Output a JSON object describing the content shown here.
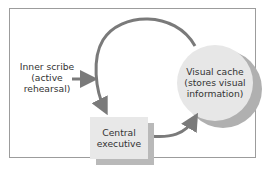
{
  "diagram": {
    "nodes": {
      "inner_scribe": {
        "label_lines": [
          "Inner scribe",
          "(active",
          "rehearsal)"
        ]
      },
      "central_executive": {
        "label_lines": [
          "Central",
          "executive"
        ]
      },
      "visual_cache": {
        "label_lines": [
          "Visual cache",
          "(stores visual",
          "information)"
        ]
      }
    },
    "edges": [
      {
        "from": "inner_scribe",
        "to": "loop"
      },
      {
        "from": "visual_cache",
        "to": "central_executive",
        "via": "top arc"
      },
      {
        "from": "central_executive",
        "to": "visual_cache",
        "via": "bottom arc"
      }
    ],
    "colors": {
      "arrow": "#7a7a7a",
      "box_fill": "#e8e8e8",
      "shadow": "#b9b9b9",
      "border": "#9c9c9c",
      "text": "#333333"
    }
  }
}
